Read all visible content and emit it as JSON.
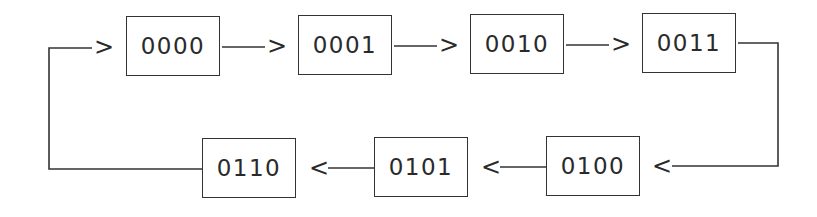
{
  "diagram": {
    "type": "state-cycle",
    "states": [
      {
        "label": "0000"
      },
      {
        "label": "0001"
      },
      {
        "label": "0010"
      },
      {
        "label": "0011"
      },
      {
        "label": "0100"
      },
      {
        "label": "0101"
      },
      {
        "label": "0110"
      }
    ],
    "arrows": {
      "right": ">",
      "left": "<"
    },
    "transitions": [
      {
        "from": "0000",
        "to": "0001"
      },
      {
        "from": "0001",
        "to": "0010"
      },
      {
        "from": "0010",
        "to": "0011"
      },
      {
        "from": "0011",
        "to": "0100"
      },
      {
        "from": "0100",
        "to": "0101"
      },
      {
        "from": "0101",
        "to": "0110"
      },
      {
        "from": "0110",
        "to": "0000"
      }
    ],
    "colors": {
      "line": "#333333",
      "text": "#2a2a2a",
      "background": "#ffffff"
    }
  }
}
